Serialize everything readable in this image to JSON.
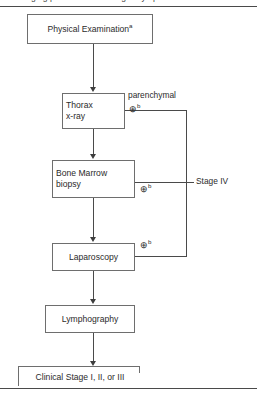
{
  "figure": {
    "clipped_caption_fragment": "Staging procedures in Hodgkin lymphoma",
    "frame_rules": [
      "top",
      "bottom"
    ]
  },
  "nodes": {
    "physical": {
      "label": "Physical Examination",
      "superscript": "a"
    },
    "thorax": {
      "line1": "Thorax",
      "line2": "x-ray"
    },
    "marrow": {
      "line1": "Bone Marrow",
      "line2": "biopsy"
    },
    "laparoscopy": {
      "label": "Laparoscopy"
    },
    "lymphography": {
      "label": "Lymphography"
    }
  },
  "branches": {
    "parenchymal_label": "parenchymal",
    "positive_symbol": "⊕",
    "positive_superscript": "b",
    "outcome_label": "Stage IV"
  },
  "terminal": {
    "label": "Clinical Stage I, II, or III"
  }
}
